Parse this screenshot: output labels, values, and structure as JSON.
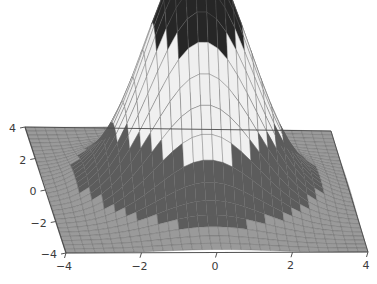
{
  "figure": {
    "kind": "surface-plot-3d",
    "width": 377,
    "height": 284,
    "background_color": "#ffffff"
  },
  "chart_data": {
    "type": "surface",
    "title": "",
    "subtitle": "",
    "xlabel": "",
    "ylabel": "",
    "zlabel": "",
    "function": "bell",
    "xlim": [
      -4,
      4
    ],
    "ylim": [
      -4,
      4
    ],
    "zlim": [
      0,
      1
    ],
    "x_ticks": [
      -4,
      -2,
      0,
      2,
      4
    ],
    "x_tick_labels": [
      "−4",
      "−2",
      "0",
      "2",
      "4"
    ],
    "y_ticks": [
      -4,
      -2,
      0,
      2,
      4
    ],
    "y_tick_labels": [
      "4",
      "2",
      "0",
      "−2",
      "−4"
    ],
    "z_ticks": [],
    "z_tick_labels": [],
    "grid": true,
    "legend": false,
    "legend_position": "none",
    "colormap": "gray-banded",
    "mesh_nx": 31,
    "mesh_ny": 31,
    "peak_height": 1.0,
    "peak_center": [
      0,
      0
    ],
    "peak_sigma": 1.35,
    "band_levels": [
      0.0,
      0.06,
      0.28,
      0.68,
      0.9
    ],
    "band_colors": [
      "#9a9a9a",
      "#5c5c5c",
      "#f2f2f2",
      "#262626",
      "#a9a9a9"
    ],
    "mesh_line_color": "#5f5f5f",
    "axis_line_color": "#4a4a4a",
    "tick_label_color": "#3b3b3b",
    "view_azimuth_deg": -37.5,
    "view_elevation_deg": 26
  },
  "axes": {
    "x_axis_name": "x-axis",
    "y_axis_name": "y-axis",
    "tick_font_size_px": 11
  }
}
